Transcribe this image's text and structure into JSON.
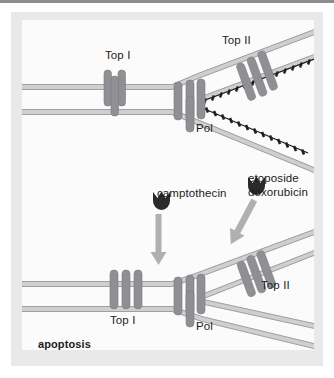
{
  "figure": {
    "background_color": "#ffffff",
    "mat_color": "#e9e9e9",
    "panel_color": "#fbfbfb",
    "rule_color": "#8e8e8e"
  },
  "colors": {
    "dna_fill": "#cfcfcf",
    "dna_stroke": "#9a9a9a",
    "protein_fill": "#8f9094",
    "protein_stroke": "#7a7b7f",
    "arrow": "#b0b0b0",
    "drug_icon": "#2a2a2a",
    "nascent_strand": "#1f1f1f",
    "text": "#1c1c1c"
  },
  "top_panel": {
    "labels": [
      {
        "name": "top-i-label",
        "text": "Top I",
        "x": 105,
        "y": 55
      },
      {
        "name": "top-ii-label",
        "text": "Top II",
        "x": 222,
        "y": 40
      },
      {
        "name": "pol-label",
        "text": "Pol",
        "x": 196,
        "y": 122
      }
    ]
  },
  "bottom_panel": {
    "labels": [
      {
        "name": "camptothecin-label",
        "text": "camptothecin",
        "x": 157,
        "y": 194
      },
      {
        "name": "etoposide-doxorubicin-label",
        "line1": "etoposide",
        "line2": "doxorubicin",
        "x": 248,
        "y": 179
      },
      {
        "name": "top-i-label",
        "text": "Top I",
        "x": 110,
        "y": 307
      },
      {
        "name": "pol-label",
        "text": "Pol",
        "x": 196,
        "y": 313
      },
      {
        "name": "top-ii-label",
        "text": "Top II",
        "x": 261,
        "y": 277
      },
      {
        "name": "apoptosis-label",
        "text": "apoptosis",
        "x": 38,
        "y": 337
      }
    ]
  },
  "legend": {
    "drug_icon_name": "drug-crescent-icon",
    "arrow_icon_name": "down-arrow-icon"
  }
}
